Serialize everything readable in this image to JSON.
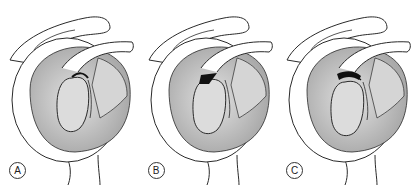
{
  "figure": {
    "panels": [
      {
        "label": "A",
        "gap": "narrow"
      },
      {
        "label": "B",
        "gap": "medium"
      },
      {
        "label": "C",
        "gap": "wide"
      }
    ],
    "colors": {
      "outline": "#2a2a2a",
      "glenoid_fill": "#bdbdbd",
      "inner_fill": "#d6d6d6",
      "bone_fill": "#ffffff",
      "shadow": "#111111"
    }
  }
}
